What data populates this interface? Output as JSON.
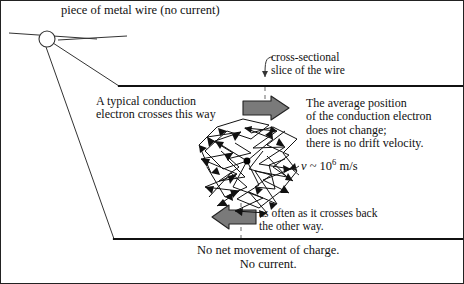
{
  "figure": {
    "domain": "physics-diagram",
    "title_caption": "piece of metal wire (no current)",
    "border_color": "#222222",
    "background": "#ffffff",
    "width": 464,
    "height": 284
  },
  "labels": {
    "wire_title": "piece of metal wire (no current)",
    "cross_section_line1": "cross-sectional",
    "cross_section_line2": "slice of the wire",
    "typical_line1": "A typical conduction",
    "typical_line2": "electron crosses this way",
    "average_line1": "The average position",
    "average_line2": "of the conduction electron",
    "average_line3": "does not change;",
    "average_line4": "there is no drift velocity.",
    "velocity_symbol": "v",
    "velocity_relation": "~",
    "velocity_base": "10",
    "velocity_exponent": "6",
    "velocity_units": "m/s",
    "often_line1": "as often as it crosses back",
    "often_line2": "the other way.",
    "no_net_line1": "No net movement of charge.",
    "no_net_line2": "No current."
  },
  "graphics": {
    "wire_wall_color": "#111111",
    "arrow_fill": "#7a7a7a",
    "arrow_stroke": "#222222",
    "scribble_stroke": "#111111",
    "electron_dot_color": "#000000",
    "dashed_line_color": "#777777",
    "leader_line_color": "#333333",
    "arrow_right_name": "electron-crosses-right-arrow",
    "arrow_left_name": "electron-crosses-left-arrow",
    "scribble_name": "electron-random-walk-path",
    "magnifier_circle_name": "wire-magnifier-circle"
  }
}
